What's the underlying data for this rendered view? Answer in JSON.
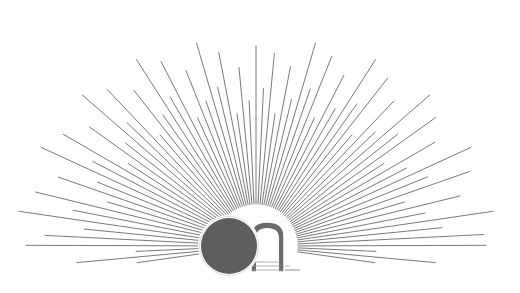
{
  "illustration": {
    "title": "Empty tomb with sunburst",
    "colors": {
      "background": "#ffffff",
      "ray": "#7a7a7a",
      "stone": "#5e5e5e",
      "stone_outline": "#e8e8e8",
      "tomb_arch": "#6a6a6a",
      "tomb_interior": "#ffffff",
      "ground_line": "#8a8a8a"
    },
    "sunburst": {
      "center_x": 256,
      "center_y": 246,
      "ray_count": 72,
      "horizon_y": 243
    },
    "stone": {
      "cx": 229,
      "cy": 246,
      "r": 29
    },
    "tomb": {
      "x": 251,
      "y": 222,
      "width": 33,
      "height": 50
    }
  }
}
